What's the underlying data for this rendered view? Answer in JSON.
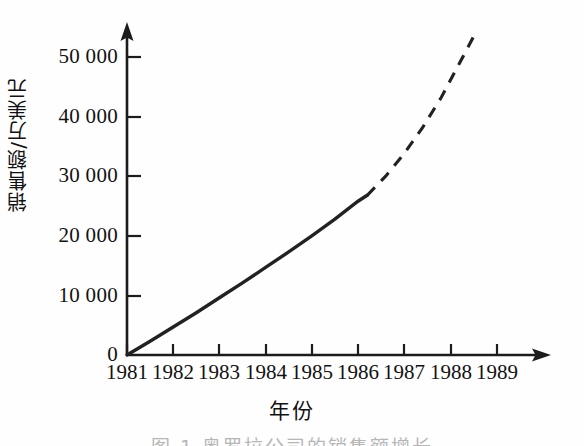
{
  "figure": {
    "caption": "图 1  奥罗拉公司的销售额增长"
  },
  "chart_data": {
    "type": "line",
    "title": "",
    "subtitle": "",
    "xlabel": "年份",
    "ylabel": "销售额/万美元",
    "grid": false,
    "legend": "none",
    "xlim": [
      1981,
      1989.6
    ],
    "ylim": [
      0,
      55000
    ],
    "x_tick_labels": [
      "1981",
      "1982",
      "1983",
      "1984",
      "1985",
      "1986",
      "1987",
      "1988",
      "1989"
    ],
    "x_ticks": [
      1981,
      1982,
      1983,
      1984,
      1985,
      1986,
      1987,
      1988,
      1989
    ],
    "y_tick_labels": [
      "0",
      "10 000",
      "20 000",
      "30 000",
      "40 000",
      "50 000"
    ],
    "y_ticks": [
      0,
      10000,
      20000,
      30000,
      40000,
      50000
    ],
    "series": [
      {
        "name": "实际销售额",
        "style": "solid",
        "color": "#222222",
        "x": [
          1981,
          1981.5,
          1982,
          1982.5,
          1983,
          1983.5,
          1984,
          1984.5,
          1985,
          1985.5,
          1986,
          1986.2
        ],
        "values": [
          0,
          2300,
          4700,
          7100,
          9600,
          12100,
          14700,
          17300,
          20000,
          22800,
          25800,
          26800
        ]
      },
      {
        "name": "预测销售额",
        "style": "dashed",
        "color": "#222222",
        "x": [
          1986.2,
          1986.6,
          1987,
          1987.4,
          1987.8,
          1988.2,
          1988.5
        ],
        "values": [
          26800,
          30000,
          33800,
          38200,
          43200,
          49000,
          53400
        ]
      }
    ],
    "annotations": [
      {
        "text": "实线为 1981—1986 年实际销售额",
        "x": 1983.5,
        "y": 14000
      },
      {
        "text": "虚线为 1986 年以后的预测值",
        "x": 1987.5,
        "y": 40000
      }
    ]
  },
  "axes": {
    "y_axis_arrow": "up-arrow-icon",
    "x_axis_arrow": "right-arrow-icon"
  }
}
